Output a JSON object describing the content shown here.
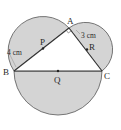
{
  "diagram": {
    "type": "geometry",
    "points": {
      "A": {
        "label": "A",
        "x": 69,
        "y": 28
      },
      "B": {
        "label": "B",
        "x": 14,
        "y": 71
      },
      "C": {
        "label": "C",
        "x": 102,
        "y": 71
      },
      "P": {
        "label": "P",
        "x": 41.5,
        "y": 49.5
      },
      "Q": {
        "label": "Q",
        "x": 58,
        "y": 71
      },
      "R": {
        "label": "R",
        "x": 85.5,
        "y": 49.5
      }
    },
    "measurements": {
      "BP": "4 cm",
      "AR": "3 cm"
    },
    "colors": {
      "fill": "#d4d4d4",
      "stroke": "#333333",
      "background": "#ffffff"
    },
    "right_angle_at": "A"
  }
}
